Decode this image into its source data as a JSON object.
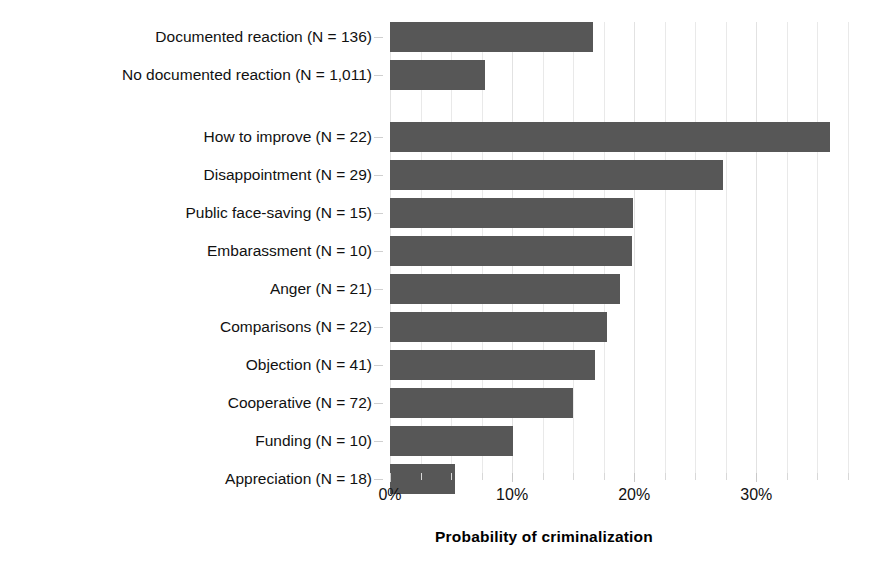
{
  "chart_data": {
    "type": "bar",
    "orientation": "horizontal",
    "title": "",
    "subtitle": "",
    "xlabel": "Probability of criminalization",
    "ylabel": "",
    "xlim": [
      0,
      38
    ],
    "xticks": [
      0,
      10,
      20,
      30
    ],
    "xtick_labels": [
      "0%",
      "10%",
      "20%",
      "30%"
    ],
    "xminor_ticks": [
      2.5,
      5,
      7.5,
      12.5,
      15,
      17.5,
      22.5,
      25,
      27.5,
      32.5,
      35,
      37.5
    ],
    "grid": true,
    "legend": "none",
    "bar_color": "#575757",
    "groups": [
      {
        "name": "overall",
        "categories": [
          "Documented reaction (N = 136)",
          "No documented reaction (N = 1,011)"
        ],
        "values": [
          16.6,
          7.8
        ]
      },
      {
        "name": "reaction-types",
        "categories": [
          "How to improve (N = 22)",
          "Disappointment (N = 29)",
          "Public face-saving (N = 15)",
          "Embarassment (N = 10)",
          "Anger (N = 21)",
          "Comparisons (N = 22)",
          "Objection (N = 41)",
          "Cooperative (N = 72)",
          "Funding (N = 10)",
          "Appreciation (N = 18)"
        ],
        "values": [
          36.0,
          27.3,
          19.9,
          19.8,
          18.8,
          17.8,
          16.8,
          15.0,
          10.1,
          5.3
        ]
      }
    ]
  }
}
